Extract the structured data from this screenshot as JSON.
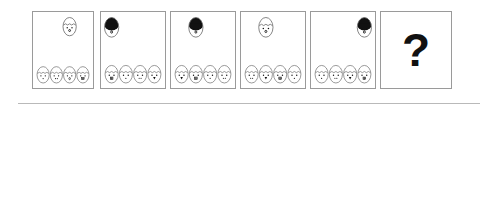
{
  "puzzle": {
    "type": "visual-analogy-sequence",
    "question_mark": "?",
    "sequence": [
      {
        "id": "panel-1",
        "big_egg": {
          "hair": "none",
          "slot": 2
        },
        "small_eggs": [
          {
            "mouth": "dot"
          },
          {
            "mouth": "two-dots"
          },
          {
            "mouth": "oval"
          },
          {
            "mouth": "teeth"
          }
        ]
      },
      {
        "id": "panel-2",
        "big_egg": {
          "hair": "black",
          "slot": 0
        },
        "small_eggs": [
          {
            "mouth": "teeth"
          },
          {
            "mouth": "dot"
          },
          {
            "mouth": "two-dots"
          },
          {
            "mouth": "tongue"
          }
        ]
      },
      {
        "id": "panel-3",
        "big_egg": {
          "hair": "black",
          "slot": 1
        },
        "small_eggs": [
          {
            "mouth": "tongue"
          },
          {
            "mouth": "teeth"
          },
          {
            "mouth": "dot"
          },
          {
            "mouth": "two-dots"
          }
        ]
      },
      {
        "id": "panel-4",
        "big_egg": {
          "hair": "none",
          "slot": 1
        },
        "small_eggs": [
          {
            "mouth": "two-dots"
          },
          {
            "mouth": "tongue"
          },
          {
            "mouth": "teeth"
          },
          {
            "mouth": "dot"
          }
        ]
      },
      {
        "id": "panel-5",
        "big_egg": {
          "hair": "black",
          "slot": 3
        },
        "small_eggs": [
          {
            "mouth": "dot"
          },
          {
            "mouth": "two-dots"
          },
          {
            "mouth": "tongue"
          },
          {
            "mouth": "teeth"
          }
        ]
      },
      {
        "id": "panel-6",
        "is_question": true
      }
    ],
    "options": [
      {
        "label": "A",
        "id": "option-a",
        "big_egg": {
          "hair": "none",
          "slot": 3
        },
        "small_eggs": [
          {
            "mouth": "teeth"
          },
          {
            "mouth": "dot"
          },
          {
            "mouth": "two-dots"
          },
          {
            "mouth": "oval"
          }
        ]
      },
      {
        "label": "B",
        "id": "option-b",
        "big_egg": {
          "hair": "black",
          "slot": 3
        },
        "small_eggs": [
          {
            "mouth": "dot"
          },
          {
            "mouth": "two-dots"
          },
          {
            "mouth": "tongue"
          },
          {
            "mouth": "teeth"
          }
        ]
      },
      {
        "label": "C",
        "id": "option-c",
        "big_egg": {
          "hair": "none",
          "slot": 3
        },
        "small_eggs": [
          {
            "mouth": "dot"
          },
          {
            "mouth": "two-dots"
          },
          {
            "mouth": "tongue"
          },
          {
            "mouth": "teeth"
          }
        ]
      },
      {
        "label": "D",
        "id": "option-d",
        "big_egg": {
          "hair": "none",
          "slot": 2
        },
        "small_eggs": [
          {
            "mouth": "two-dots"
          },
          {
            "mouth": "dot"
          },
          {
            "mouth": "teeth"
          },
          {
            "mouth": "tongue"
          }
        ]
      },
      {
        "label": "E",
        "id": "option-e",
        "big_egg": {
          "hair": "none",
          "slot": 3
        },
        "small_eggs": [
          {
            "mouth": "teeth"
          },
          {
            "mouth": "dot"
          },
          {
            "mouth": "two-dots"
          },
          {
            "mouth": "tongue"
          }
        ]
      }
    ]
  },
  "colors": {
    "border": "#9a9a9a",
    "divider": "#b9b9b9",
    "ink": "#111111",
    "hair": "#111111",
    "badge_bg": "#1b1b1b",
    "badge_text": "#ffffff",
    "egg_line": "#6f6f6f",
    "background": "#ffffff"
  }
}
